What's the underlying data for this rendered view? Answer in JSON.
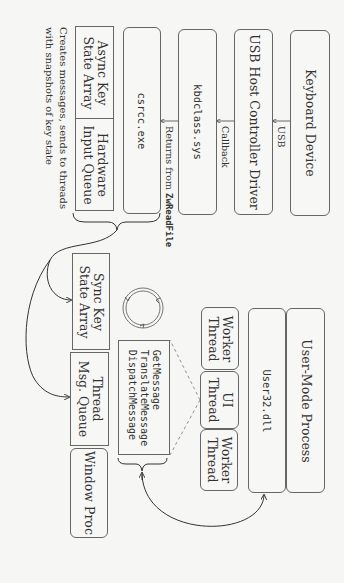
{
  "diagram": {
    "orientation": "rotated 90 degrees clockwise",
    "kernel_chain": [
      {
        "id": "keyboard_device",
        "label": "Keyboard Device"
      },
      {
        "id": "usb_host",
        "label": "USB Host Controller Driver"
      },
      {
        "id": "kbdclass",
        "label": "kbdclass.sys"
      },
      {
        "id": "csrss",
        "label": "csrcc.exe"
      }
    ],
    "edges": {
      "usb": "USB",
      "callback": "Callback",
      "returns_prefix": "Returns from ",
      "returns_fn": "ZwReadFile"
    },
    "raw_input": {
      "async_key": {
        "line1": "Async Key",
        "line2": "State Array"
      },
      "hw_queue": {
        "line1": "Hardware",
        "line2": "Input Queue"
      }
    },
    "annotation": {
      "line1": "Creates messages, sends to threads",
      "line2": "with snapshots of key state"
    },
    "thread_side": {
      "sync_key": {
        "line1": "Sync Key",
        "line2": "State Array"
      },
      "msg_queue": {
        "line1": "Thread",
        "line2": "Msg. Queue"
      },
      "window_proc": "Window Proc"
    },
    "message_loop": [
      "GetMessage",
      "TranslateMessage",
      "DispatchMessage"
    ],
    "process": {
      "user_mode": "User-Mode Process",
      "user32": "User32.dll",
      "threads": [
        {
          "line1": "Worker",
          "line2": "Thread"
        },
        {
          "line1": "UI",
          "line2": "Thread"
        },
        {
          "line1": "Worker",
          "line2": "Thread"
        }
      ]
    },
    "colors": {
      "stroke": "#444444",
      "box_border": "#666666",
      "background": "#f6f6f4"
    }
  }
}
